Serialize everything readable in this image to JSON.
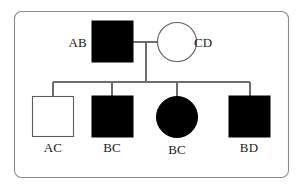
{
  "diagram": {
    "kind": "pedigree-chart",
    "background_color": "#ffffff",
    "frame_color": "#8a8a8a",
    "line_color": "#6d6d6d",
    "affected_fill": "#000000",
    "unaffected_fill": "#ffffff",
    "generations": [
      {
        "name": "generation-1",
        "members": [
          {
            "id": "father",
            "label": "AB",
            "sex": "male",
            "shape": "square",
            "affected": true,
            "label_position": "left"
          },
          {
            "id": "mother",
            "label": "CD",
            "sex": "female",
            "shape": "circle",
            "affected": false,
            "label_position": "right"
          }
        ]
      },
      {
        "name": "generation-2",
        "members": [
          {
            "id": "child-1",
            "label": "AC",
            "sex": "male",
            "shape": "square",
            "affected": false,
            "label_position": "below"
          },
          {
            "id": "child-2",
            "label": "BC",
            "sex": "male",
            "shape": "square",
            "affected": true,
            "label_position": "below"
          },
          {
            "id": "child-3",
            "label": "BC",
            "sex": "female",
            "shape": "circle",
            "affected": true,
            "label_position": "below"
          },
          {
            "id": "child-4",
            "label": "BD",
            "sex": "male",
            "shape": "square",
            "affected": true,
            "label_position": "below"
          }
        ]
      }
    ]
  }
}
